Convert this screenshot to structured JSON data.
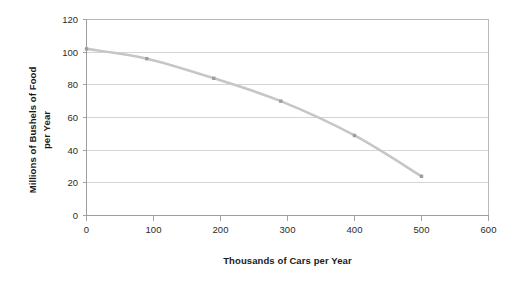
{
  "chart_data": {
    "type": "line",
    "title": "",
    "xlabel": "Thousands of Cars per Year",
    "ylabel": "Millions of Bushels of Food per Year",
    "xlim": [
      0,
      600
    ],
    "ylim": [
      0,
      120
    ],
    "xticks": [
      0,
      100,
      200,
      300,
      400,
      500,
      600
    ],
    "xtick_labels": [
      "0",
      "100",
      "200",
      "300",
      "400",
      "500",
      "600"
    ],
    "yticks": [
      0,
      20,
      40,
      60,
      80,
      100,
      120
    ],
    "ytick_labels": [
      "0",
      "20",
      "40",
      "60",
      "80",
      "100",
      "120"
    ],
    "grid": "horizontal",
    "legend": "none",
    "series": [
      {
        "name": "Production Possibilities Frontier",
        "line_color": "#c6c6c6",
        "marker_color": "#9d9d9d",
        "x": [
          0,
          90,
          190,
          290,
          400,
          500
        ],
        "values": [
          102,
          96,
          84,
          70,
          49,
          24
        ]
      }
    ]
  },
  "axes": {
    "y_title": "Millions of Bushels of Food per Year",
    "y_title_line1": "Millions of Bushels of Food",
    "y_title_line2": "per Year",
    "x_title": "Thousands of Cars per Year"
  },
  "colors": {
    "line": "#c6c6c6",
    "marker": "#9d9d9d",
    "grid": "#c9c9c9",
    "border": "#b4b4b4",
    "text": "#1a1a1a",
    "background": "#ffffff"
  }
}
